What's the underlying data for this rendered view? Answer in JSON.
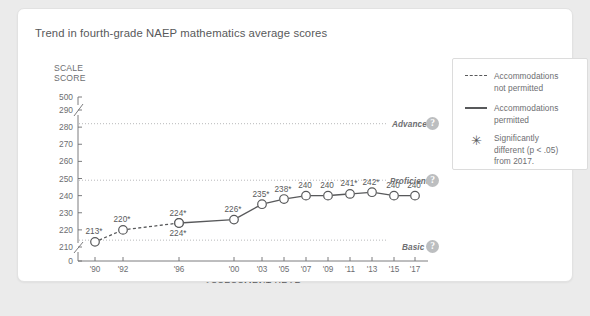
{
  "card": {
    "title": "Trend in fourth-grade NAEP mathematics average scores"
  },
  "axes": {
    "y_caption_line1": "SCALE",
    "y_caption_line2": "SCORE",
    "y_ticks": [
      "500",
      "290",
      "280",
      "270",
      "260",
      "250",
      "240",
      "230",
      "220",
      "210",
      "0"
    ],
    "x_title": "ASSESSMENT YEAR"
  },
  "achievement_levels": [
    {
      "name": "Advanced",
      "value": 282,
      "help_icon": "question-mark-icon",
      "help_label": "?"
    },
    {
      "name": "Proficient",
      "value": 249,
      "help_icon": "question-mark-icon",
      "help_label": "?"
    },
    {
      "name": "Basic",
      "value": 214,
      "help_icon": "question-mark-icon",
      "help_label": "?"
    }
  ],
  "legend": {
    "items": [
      {
        "key": "dashed-line-swatch",
        "line1": "Accommodations",
        "line2": "not permitted"
      },
      {
        "key": "solid-line-swatch",
        "line1": "Accommodations",
        "line2": "permitted"
      },
      {
        "key": "asterisk-symbol",
        "glyph": "✳",
        "line1": "Significantly",
        "line2": "different (p < .05)",
        "line3": "from 2017."
      }
    ]
  },
  "chart_data": {
    "type": "line",
    "title": "Trend in fourth-grade NAEP mathematics average scores",
    "xlabel": "ASSESSMENT YEAR",
    "ylabel": "SCALE SCORE",
    "ylim": [
      205,
      500
    ],
    "grid": "horizontal dotted reference lines at achievement levels",
    "legend_position": "right",
    "categories": [
      "'90",
      "'92",
      "'96",
      "'00",
      "'03",
      "'05",
      "'07",
      "'09",
      "'11",
      "'13",
      "'15",
      "'17"
    ],
    "series": [
      {
        "name": "Accommodations not permitted",
        "style": "dashed",
        "x": [
          "'90",
          "'92",
          "'96"
        ],
        "values": [
          213,
          220,
          224
        ],
        "labels": [
          "213*",
          "220*",
          "224*"
        ],
        "significant": [
          true,
          true,
          true
        ]
      },
      {
        "name": "Accommodations permitted",
        "style": "solid",
        "x": [
          "'96",
          "'00",
          "'03",
          "'05",
          "'07",
          "'09",
          "'11",
          "'13",
          "'15",
          "'17"
        ],
        "values": [
          224,
          226,
          235,
          238,
          240,
          240,
          241,
          242,
          240,
          240
        ],
        "labels": [
          "224*",
          "226*",
          "235*",
          "238*",
          "240",
          "240",
          "241*",
          "242*",
          "240",
          "240"
        ],
        "significant": [
          true,
          true,
          true,
          true,
          false,
          false,
          true,
          true,
          false,
          false
        ]
      }
    ],
    "reference_lines": [
      {
        "label": "Advanced",
        "value": 282
      },
      {
        "label": "Proficient",
        "value": 249
      },
      {
        "label": "Basic",
        "value": 214
      }
    ],
    "annotations": [
      "* Significantly different (p < .05) from 2017."
    ]
  }
}
